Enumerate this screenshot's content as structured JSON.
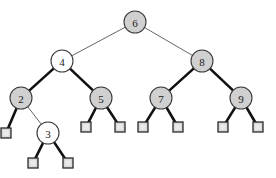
{
  "figure": {
    "name": "binary-search-tree-diagram",
    "type": "tree-diagram",
    "background_color": "#ffffff"
  },
  "style": {
    "node_fill_gray": "#d0d0d0",
    "node_fill_white": "#ffffff",
    "node_stroke": "#3a3a3a",
    "leaf_fill": "#d8d8d8",
    "leaf_stroke": "#2a2a2a",
    "edge_thin_color": "#555555",
    "edge_thick_color": "#111111",
    "edge_thin_width": 0.9,
    "edge_thick_width": 2.6,
    "node_radius": 11,
    "leaf_size": 10,
    "label_color": "#1a1a1a"
  },
  "nodes": [
    {
      "id": "n6",
      "label": "6",
      "cx": 135,
      "cy": 22,
      "fill": "gray",
      "depth": 0
    },
    {
      "id": "n4",
      "label": "4",
      "cx": 62,
      "cy": 61,
      "fill": "white",
      "depth": 1
    },
    {
      "id": "n8",
      "label": "8",
      "cx": 202,
      "cy": 61,
      "fill": "gray",
      "depth": 1
    },
    {
      "id": "n2",
      "label": "2",
      "cx": 21,
      "cy": 98,
      "fill": "gray",
      "depth": 2
    },
    {
      "id": "n5",
      "label": "5",
      "cx": 101,
      "cy": 98,
      "fill": "gray",
      "depth": 2
    },
    {
      "id": "n7",
      "label": "7",
      "cx": 161,
      "cy": 98,
      "fill": "gray",
      "depth": 2
    },
    {
      "id": "n9",
      "label": "9",
      "cx": 241,
      "cy": 98,
      "fill": "gray",
      "depth": 2
    },
    {
      "id": "n3",
      "label": "3",
      "cx": 48,
      "cy": 133,
      "fill": "white",
      "depth": 3
    }
  ],
  "leaves": [
    {
      "id": "l2L",
      "cx": 6,
      "cy": 133,
      "parent": "n2",
      "side": "left"
    },
    {
      "id": "l5L",
      "cx": 86,
      "cy": 127,
      "parent": "n5",
      "side": "left"
    },
    {
      "id": "l5R",
      "cx": 120,
      "cy": 127,
      "parent": "n5",
      "side": "right"
    },
    {
      "id": "l7L",
      "cx": 143,
      "cy": 127,
      "parent": "n7",
      "side": "left"
    },
    {
      "id": "l7R",
      "cx": 178,
      "cy": 127,
      "parent": "n7",
      "side": "right"
    },
    {
      "id": "l9L",
      "cx": 223,
      "cy": 127,
      "parent": "n9",
      "side": "left"
    },
    {
      "id": "l9R",
      "cx": 258,
      "cy": 127,
      "parent": "n9",
      "side": "right"
    },
    {
      "id": "l3L",
      "cx": 33,
      "cy": 163,
      "parent": "n3",
      "side": "left"
    },
    {
      "id": "l3R",
      "cx": 68,
      "cy": 163,
      "parent": "n3",
      "side": "right"
    }
  ],
  "edges": [
    {
      "from": "n6",
      "to": "n4",
      "weight": "thin",
      "name": "edge-6-4"
    },
    {
      "from": "n6",
      "to": "n8",
      "weight": "thin",
      "name": "edge-6-8"
    },
    {
      "from": "n4",
      "to": "n2",
      "weight": "thick",
      "name": "edge-4-2"
    },
    {
      "from": "n4",
      "to": "n5",
      "weight": "thick",
      "name": "edge-4-5"
    },
    {
      "from": "n2",
      "to": "n3",
      "weight": "thin",
      "name": "edge-2-3"
    },
    {
      "from": "n2",
      "to": "l2L",
      "weight": "thick",
      "name": "edge-2-nil-left"
    },
    {
      "from": "n3",
      "to": "l3L",
      "weight": "thick",
      "name": "edge-3-nil-left"
    },
    {
      "from": "n3",
      "to": "l3R",
      "weight": "thick",
      "name": "edge-3-nil-right"
    },
    {
      "from": "n5",
      "to": "l5L",
      "weight": "thick",
      "name": "edge-5-nil-left"
    },
    {
      "from": "n5",
      "to": "l5R",
      "weight": "thick",
      "name": "edge-5-nil-right"
    },
    {
      "from": "n8",
      "to": "n7",
      "weight": "thick",
      "name": "edge-8-7"
    },
    {
      "from": "n8",
      "to": "n9",
      "weight": "thick",
      "name": "edge-8-9"
    },
    {
      "from": "n7",
      "to": "l7L",
      "weight": "thick",
      "name": "edge-7-nil-left"
    },
    {
      "from": "n7",
      "to": "l7R",
      "weight": "thick",
      "name": "edge-7-nil-right"
    },
    {
      "from": "n9",
      "to": "l9L",
      "weight": "thick",
      "name": "edge-9-nil-left"
    },
    {
      "from": "n9",
      "to": "l9R",
      "weight": "thick",
      "name": "edge-9-nil-right"
    }
  ]
}
